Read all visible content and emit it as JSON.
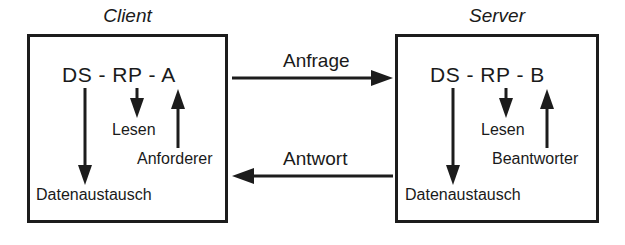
{
  "diagram": {
    "background_color": "#ffffff",
    "stroke_color": "#1c1c1c",
    "text_color": "#1a1a1a",
    "client": {
      "title": "Client",
      "stack_label": "DS - RP - A",
      "read_label": "Lesen",
      "role_label": "Anforderer",
      "exchange_label": "Datenaustausch",
      "arrows": [
        {
          "name": "data-exchange-arrow",
          "direction": "down",
          "from": "DS",
          "to": "Datenaustausch"
        },
        {
          "name": "read-arrow",
          "direction": "down",
          "from": "RP",
          "to": "Lesen"
        },
        {
          "name": "requester-arrow",
          "direction": "up",
          "from": "Anforderer",
          "to": "A"
        }
      ]
    },
    "server": {
      "title": "Server",
      "stack_label": "DS - RP - B",
      "read_label": "Lesen",
      "role_label": "Beantworter",
      "exchange_label": "Datenaustausch",
      "arrows": [
        {
          "name": "data-exchange-arrow",
          "direction": "down",
          "from": "DS",
          "to": "Datenaustausch"
        },
        {
          "name": "read-arrow",
          "direction": "down",
          "from": "RP",
          "to": "Lesen"
        },
        {
          "name": "responder-arrow",
          "direction": "up",
          "from": "Beantworter",
          "to": "B"
        }
      ]
    },
    "messages": [
      {
        "name": "request-message",
        "label": "Anfrage",
        "direction": "client-to-server"
      },
      {
        "name": "response-message",
        "label": "Antwort",
        "direction": "server-to-client"
      }
    ]
  }
}
